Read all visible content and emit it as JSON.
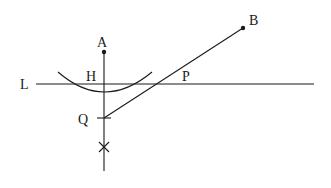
{
  "diagram": {
    "type": "geometric-construction",
    "labels": {
      "A": "A",
      "B": "B",
      "L": "L",
      "H": "H",
      "P": "P",
      "Q": "Q"
    },
    "points": {
      "A": [
        104,
        52
      ],
      "B": [
        243,
        28
      ],
      "Q": [
        104,
        118
      ],
      "X_mark": [
        104,
        147
      ]
    },
    "line_L": {
      "y": 84,
      "x1": 36,
      "x2": 314
    },
    "colors": {
      "stroke": "#1a1a1a",
      "background": "#ffffff"
    }
  }
}
